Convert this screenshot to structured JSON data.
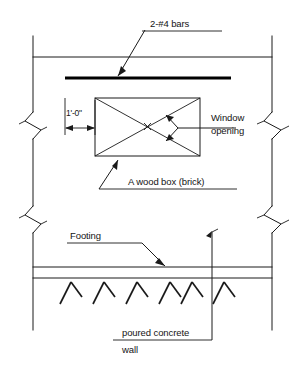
{
  "drawing": {
    "title": "Window opening in poured concrete wall detail",
    "background_color": "#ffffff",
    "line_color": "#1a1a1a",
    "labels": {
      "rebar": "2-#4 bars",
      "dimension": "1'-0\"",
      "window_opening_line1": "Window",
      "window_opening_line2": "opening",
      "wood_box": "A wood box (brick)",
      "footing": "Footing",
      "poured_concrete_line1": "poured concrete",
      "poured_concrete_line2": "wall"
    },
    "icons": {
      "break_symbol": "zigzag-break-symbol",
      "hatch": "concrete-hatch-tick",
      "arrowhead": "leader-arrowhead"
    },
    "elements": {
      "wall_left_x": 33,
      "wall_right_x": 272,
      "top_line_y": 57,
      "footing_top_y": 267,
      "footing_bottom_y": 278,
      "rebar_y": 78,
      "box": {
        "x": 95,
        "y": 98,
        "width": 105,
        "height": 58
      },
      "hatch_count": 6
    }
  }
}
